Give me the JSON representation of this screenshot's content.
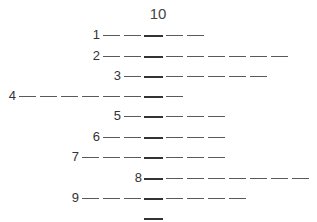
{
  "puzzle": {
    "title": "10",
    "key_column_x": 145,
    "pitch": 21,
    "rows": [
      {
        "label": "1",
        "y": 35,
        "length": 5,
        "key_index": 3
      },
      {
        "label": "2",
        "y": 56,
        "length": 9,
        "key_index": 3
      },
      {
        "label": "3",
        "y": 76,
        "length": 7,
        "key_index": 2
      },
      {
        "label": "4",
        "y": 96,
        "length": 8,
        "key_index": 7
      },
      {
        "label": "5",
        "y": 116,
        "length": 5,
        "key_index": 2
      },
      {
        "label": "6",
        "y": 137,
        "length": 6,
        "key_index": 3
      },
      {
        "label": "7",
        "y": 157,
        "length": 7,
        "key_index": 4
      },
      {
        "label": "8",
        "y": 178,
        "length": 8,
        "key_index": 1
      },
      {
        "label": "9",
        "y": 198,
        "length": 8,
        "key_index": 4
      },
      {
        "label": "",
        "y": 218,
        "length": 1,
        "key_index": 1
      }
    ]
  }
}
